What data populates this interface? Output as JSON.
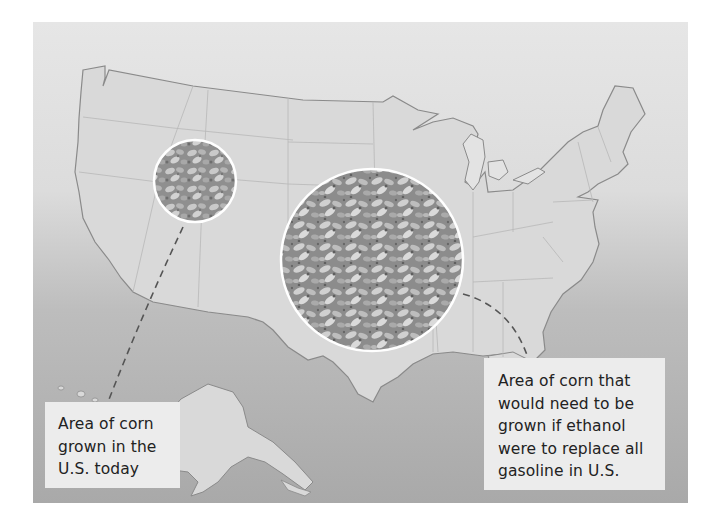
{
  "figure": {
    "colors": {
      "page_background": "#ffffff",
      "land": "#d9d9d9",
      "ocean_top": "#e6e6e6",
      "ocean_bottom": "#a9a9a9",
      "state_borders": "#b8b8b8",
      "coastline": "#8a8a8a",
      "label_box": "#ececec",
      "label_text": "#222222",
      "leader_line": "#555555",
      "circle_outline": "#ffffff",
      "corn_texture_base": "#9a9a9a"
    }
  },
  "circles": {
    "current": {
      "name": "current-corn-area",
      "center": [
        162,
        159
      ],
      "radius": 41
    },
    "required": {
      "name": "required-corn-area",
      "center": [
        339,
        238
      ],
      "radius": 91
    }
  },
  "labels": {
    "current": {
      "lines": [
        "Area of corn",
        "grown in the",
        "U.S. today"
      ]
    },
    "required": {
      "lines": [
        "Area of corn that",
        "would need to be",
        "grown if ethanol",
        "were to replace all",
        "gasoline in U.S."
      ]
    }
  },
  "leaders": {
    "current": {
      "style": "dashed",
      "from": "small circle",
      "to": "left label"
    },
    "required": {
      "style": "dashed",
      "from": "large circle",
      "to": "right label"
    }
  }
}
